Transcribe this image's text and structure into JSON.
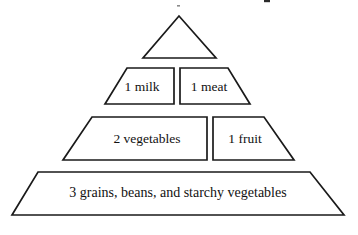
{
  "figure": {
    "background_color": "#ffffff",
    "stroke_color": "#1a1a1a",
    "text_color": "#111111"
  },
  "pyramid": {
    "tiers": [
      {
        "id": "apex",
        "level": 1,
        "label": "",
        "shape": "triangle",
        "segments": 1
      },
      {
        "id": "tier-milk-meat",
        "level": 2,
        "shape": "trapezoid",
        "segments": 2,
        "left_label": "1 milk",
        "right_label": "1 meat"
      },
      {
        "id": "tier-vegetables-fruit",
        "level": 3,
        "shape": "trapezoid",
        "segments": 2,
        "left_label": "2 vegetables",
        "right_label": "1 fruit"
      },
      {
        "id": "tier-grains",
        "level": 4,
        "shape": "trapezoid",
        "segments": 1,
        "label": "3 grains, beans, and starchy vegetables"
      }
    ]
  },
  "labels": {
    "apex": "",
    "milk": "1 milk",
    "meat": "1 meat",
    "vegetables": "2 vegetables",
    "fruit": "1 fruit",
    "grains": "3 grains, beans, and starchy vegetables"
  }
}
